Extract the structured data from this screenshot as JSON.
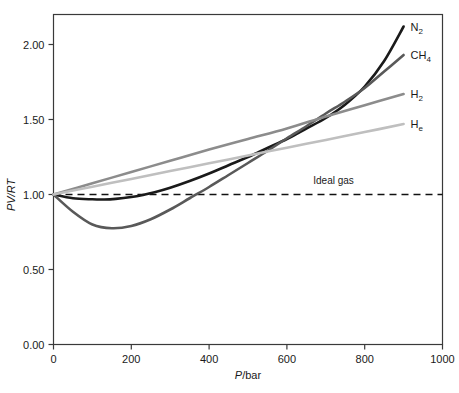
{
  "chart_data": {
    "type": "line",
    "title": "",
    "xlabel": "P/bar",
    "ylabel": "PV/RT",
    "xlim": [
      0,
      1000
    ],
    "ylim": [
      0.0,
      2.2
    ],
    "xticks": [
      "0",
      "200",
      "400",
      "600",
      "800",
      "1000"
    ],
    "xtick_values": [
      0,
      200,
      400,
      600,
      800,
      1000
    ],
    "yticks": [
      "0.00",
      "0.50",
      "1.00",
      "1.50",
      "2.00"
    ],
    "ytick_values": [
      0.0,
      0.5,
      1.0,
      1.5,
      2.0
    ],
    "grid": false,
    "legend_position": "right-inline-labels",
    "annotations": [
      {
        "name": "ideal-gas-line-label",
        "text": "Ideal gas",
        "x": 720,
        "y": 1.07
      }
    ],
    "reference_lines": [
      {
        "name": "ideal-gas",
        "label": "Ideal gas",
        "y": 1.0,
        "style": "dashed",
        "color": "#111111"
      }
    ],
    "series": [
      {
        "name": "N2",
        "label": "N",
        "label_sub": "2",
        "color": "#1a1a1a",
        "x": [
          0,
          50,
          100,
          130,
          160,
          200,
          230,
          260,
          300,
          350,
          400,
          450,
          500,
          550,
          600,
          650,
          700,
          750,
          800,
          850,
          900
        ],
        "values": [
          1.0,
          0.975,
          0.968,
          0.967,
          0.971,
          0.983,
          0.997,
          1.015,
          1.045,
          1.09,
          1.14,
          1.195,
          1.25,
          1.31,
          1.37,
          1.44,
          1.51,
          1.6,
          1.72,
          1.89,
          2.12
        ]
      },
      {
        "name": "CH4",
        "label": "CH",
        "label_sub": "4",
        "color": "#595959",
        "x": [
          0,
          50,
          100,
          150,
          200,
          250,
          300,
          350,
          400,
          450,
          500,
          550,
          600,
          650,
          700,
          750,
          800,
          850,
          900
        ],
        "values": [
          1.0,
          0.885,
          0.8,
          0.775,
          0.79,
          0.835,
          0.9,
          0.975,
          1.05,
          1.13,
          1.21,
          1.29,
          1.375,
          1.455,
          1.54,
          1.62,
          1.71,
          1.82,
          1.93
        ]
      },
      {
        "name": "H2",
        "label": "H",
        "label_sub": "2",
        "color": "#8c8c8c",
        "x": [
          0,
          100,
          200,
          300,
          400,
          500,
          600,
          700,
          800,
          900
        ],
        "values": [
          1.0,
          1.075,
          1.15,
          1.225,
          1.3,
          1.37,
          1.44,
          1.52,
          1.595,
          1.67
        ]
      },
      {
        "name": "He",
        "label": "H",
        "label_sub": "e",
        "color": "#bfbfbf",
        "x": [
          0,
          100,
          200,
          300,
          400,
          500,
          600,
          700,
          800,
          900
        ],
        "values": [
          1.0,
          1.052,
          1.104,
          1.156,
          1.208,
          1.26,
          1.312,
          1.364,
          1.416,
          1.47
        ]
      }
    ]
  },
  "axes": {
    "x_title_italic": "P",
    "x_title_rest": "/bar",
    "y_title_italic": "PV",
    "y_title_rest": "/RT"
  },
  "colors": {
    "frame": "#3a3a3a",
    "text": "#1a1a1a",
    "background": "#ffffff",
    "n2": "#1a1a1a",
    "ch4": "#595959",
    "h2": "#8c8c8c",
    "he": "#bfbfbf",
    "ideal": "#111111"
  }
}
